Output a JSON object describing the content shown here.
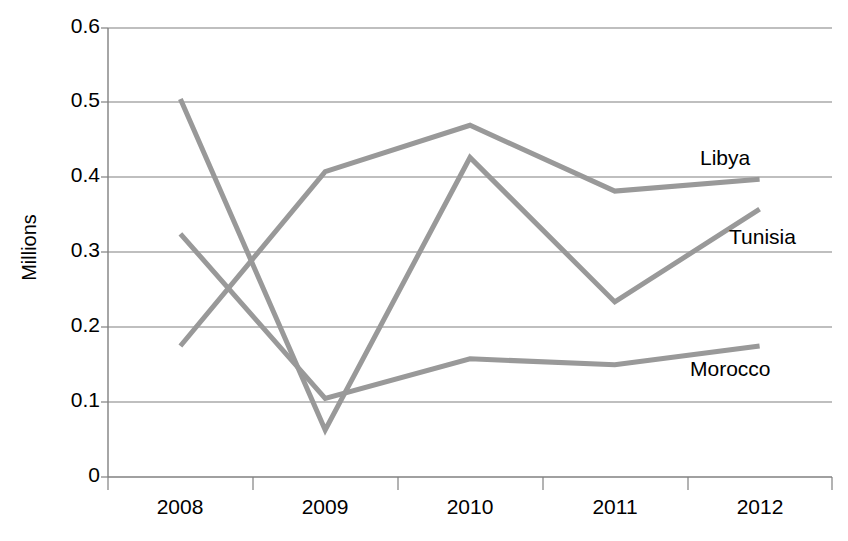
{
  "chart_data": {
    "type": "line",
    "title": "",
    "xlabel": "",
    "ylabel": "Millions",
    "categories": [
      "2008",
      "2009",
      "2010",
      "2011",
      "2012"
    ],
    "ylim": [
      0,
      0.6
    ],
    "yticks": [
      "0",
      "0.1",
      "0.2",
      "0.3",
      "0.4",
      "0.5",
      "0.6"
    ],
    "grid": true,
    "legend_position": "inline-right-labels",
    "line_color": "#999999",
    "series": [
      {
        "name": "Libya",
        "label": "Libya",
        "values": [
          0.175,
          0.408,
          0.47,
          0.382,
          0.398
        ]
      },
      {
        "name": "Tunisia",
        "label": "Tunisia",
        "values": [
          0.505,
          0.063,
          0.427,
          0.234,
          0.358
        ]
      },
      {
        "name": "Morocco",
        "label": "Morocco",
        "values": [
          0.325,
          0.105,
          0.158,
          0.15,
          0.175
        ]
      }
    ]
  },
  "axes": {
    "y_title": "Millions",
    "y_tick_labels": [
      "0.6",
      "0.5",
      "0.4",
      "0.3",
      "0.2",
      "0.1",
      "0"
    ],
    "x_tick_labels": [
      "2008",
      "2009",
      "2010",
      "2011",
      "2012"
    ]
  },
  "labels": {
    "libya": "Libya",
    "tunisia": "Tunisia",
    "morocco": "Morocco"
  },
  "colors": {
    "line": "#999999",
    "grid": "#808080",
    "axis": "#808080",
    "text": "#000000"
  }
}
